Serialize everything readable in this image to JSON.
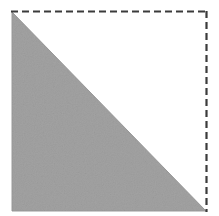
{
  "figure": {
    "title": "Shaded right triangle inscribed in a dashed square",
    "canvas": {
      "width": 219,
      "height": 216,
      "background_color": "#ffffff"
    },
    "square": {
      "name": "dashed-square-outline",
      "left": 12,
      "top": 11,
      "right": 207,
      "bottom": 211,
      "side_length_px": 196,
      "stroke_color": "#3b3b3b",
      "stroke_width": 2,
      "dash_length": 7,
      "dash_gap": 4,
      "edges_drawn": [
        "top",
        "right"
      ],
      "edges_hidden": [
        "left",
        "bottom"
      ],
      "top_edge_label": "top dashed edge",
      "right_edge_label": "right dashed edge"
    },
    "triangle": {
      "name": "shaded-right-triangle",
      "fill_color": "#a2a2a2",
      "edge_color": "#9a9a9a",
      "vertices": [
        {
          "label": "top-left vertex",
          "x": 12,
          "y": 12
        },
        {
          "label": "bottom-left vertex",
          "x": 12,
          "y": 211
        },
        {
          "label": "bottom-right vertex",
          "x": 206,
          "y": 211
        }
      ],
      "hypotenuse_label": "hypotenuse from top-left to bottom-right",
      "right_angle_at": "bottom-left vertex",
      "legs": [
        "left vertical leg",
        "bottom horizontal leg"
      ],
      "area_fraction_of_square": "1/2"
    },
    "accessible_description": "A square outlined with a dashed dark gray line along its top and right sides. The lower-left half of the square is filled with a flat medium gray, forming a right triangle whose hypotenuse runs from the top-left corner down to the bottom-right corner."
  }
}
